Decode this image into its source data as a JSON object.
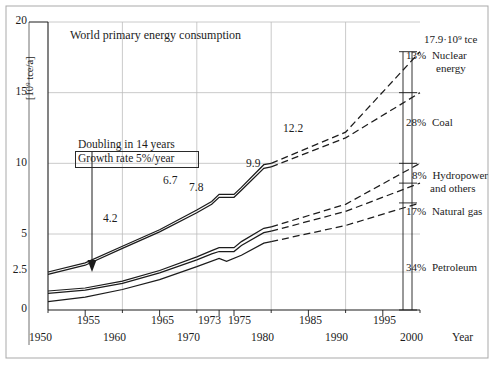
{
  "chart_data": {
    "type": "line",
    "title": "World primary energy consumption",
    "xlabel": "Year",
    "ylabel": "[10⁹ tce/a]",
    "xlim": [
      1950,
      2000
    ],
    "ylim": [
      0,
      20
    ],
    "grid": true,
    "legend_position": "right-outside",
    "y_ticks": [
      "0",
      "2.5",
      "5",
      "10",
      "15",
      "20"
    ],
    "y_tick_values": [
      0,
      2.5,
      5,
      10,
      15,
      20
    ],
    "x_ticks_upper": [
      "1955",
      "1965",
      "1973",
      "1975",
      "1985",
      "1995"
    ],
    "x_ticks_upper_values": [
      1955,
      1965,
      1973,
      1975,
      1985,
      1995
    ],
    "x_ticks_lower": [
      "1950",
      "1960",
      "1970",
      "1980",
      "1990",
      "2000"
    ],
    "x_ticks_lower_values": [
      1950,
      1960,
      1970,
      1980,
      1990,
      2000
    ],
    "annotations": [
      {
        "text": "Doubling in 14 years",
        "x": 1957.5,
        "y": 11.6
      },
      {
        "text": "Growth rate 5%/year",
        "x": 1957.5,
        "y": 10.6,
        "boxed": true
      }
    ],
    "data_labels": [
      {
        "text": "2.5",
        "value": 2.5,
        "x": 1950
      },
      {
        "text": "4.2",
        "value": 4.2,
        "x": 1960
      },
      {
        "text": "6.7",
        "value": 6.7,
        "x": 1970
      },
      {
        "text": "7.8",
        "value": 7.8,
        "x": 1973
      },
      {
        "text": "9.9",
        "value": 9.9,
        "x": 1979
      },
      {
        "text": "12.2",
        "value": 12.2,
        "x": 1990
      },
      {
        "text": "17.9·10⁹ tce",
        "value": 17.9,
        "x": 2000
      }
    ],
    "series": [
      {
        "name": "Total primary energy (cumulative top)",
        "style": "solid-then-dashed",
        "dash_from_x": 1980,
        "x": [
          1950,
          1955,
          1960,
          1965,
          1970,
          1972,
          1973,
          1975,
          1976,
          1979,
          1980,
          1990,
          2000
        ],
        "y": [
          2.5,
          3.1,
          4.2,
          5.3,
          6.7,
          7.3,
          7.8,
          7.8,
          8.3,
          9.9,
          10.0,
          12.2,
          17.9
        ]
      },
      {
        "name": "Total primary energy (cumulative, lower trace)",
        "style": "solid-then-dashed",
        "dash_from_x": 1980,
        "x": [
          1950,
          1955,
          1960,
          1965,
          1970,
          1972,
          1973,
          1975,
          1976,
          1979,
          1980,
          1990,
          2000
        ],
        "y": [
          2.35,
          2.95,
          4.05,
          5.15,
          6.5,
          7.1,
          7.6,
          7.6,
          8.1,
          9.65,
          9.75,
          11.8,
          15.0
        ]
      },
      {
        "name": "Fossil + hydro cumulative (upper)",
        "style": "solid-then-dashed",
        "dash_from_x": 1980,
        "x": [
          1950,
          1955,
          1960,
          1965,
          1970,
          1972,
          1973,
          1975,
          1976,
          1979,
          1980,
          1990,
          2000
        ],
        "y": [
          1.25,
          1.45,
          1.9,
          2.6,
          3.5,
          3.9,
          4.1,
          4.1,
          4.5,
          5.4,
          5.5,
          7.1,
          10.0
        ]
      },
      {
        "name": "Fossil + hydro cumulative (lower)",
        "style": "solid-then-dashed",
        "dash_from_x": 1980,
        "x": [
          1950,
          1955,
          1960,
          1965,
          1970,
          1972,
          1973,
          1975,
          1976,
          1979,
          1980,
          1990,
          2000
        ],
        "y": [
          1.1,
          1.3,
          1.75,
          2.45,
          3.3,
          3.7,
          3.85,
          3.85,
          4.25,
          5.1,
          5.2,
          6.6,
          8.6
        ]
      },
      {
        "name": "Petroleum + natural gas cumulative",
        "style": "solid-then-dashed",
        "dash_from_x": 1980,
        "x": [
          1950,
          1955,
          1960,
          1965,
          1970,
          1973,
          1974,
          1976,
          1979,
          1980,
          1990,
          2000
        ],
        "y": [
          0.55,
          0.85,
          1.35,
          2.0,
          2.85,
          3.4,
          3.2,
          3.6,
          4.4,
          4.5,
          5.6,
          7.2
        ]
      }
    ],
    "share_labels": [
      {
        "percent": "13%",
        "name": "Nuclear",
        "name2": "energy",
        "y_top": 17.9,
        "y_bottom": 15.0
      },
      {
        "percent": "28%",
        "name": "Coal",
        "name2": "",
        "y_top": 15.0,
        "y_bottom": 10.0
      },
      {
        "percent": "8%",
        "name": "Hydropower",
        "name2": "and others",
        "y_top": 10.0,
        "y_bottom": 8.6
      },
      {
        "percent": "17%",
        "name": "Natural gas",
        "name2": "",
        "y_top": 8.6,
        "y_bottom": 7.2
      },
      {
        "percent": "34%",
        "name": "Petroleum",
        "name2": "",
        "y_top": 7.2,
        "y_bottom": 0.0
      }
    ],
    "total_label": "17.9·10⁹ tce"
  },
  "colors": {
    "ink": "#1c1c1c",
    "grid": "#b8b8b8",
    "frame": "#9a9a9a",
    "background": "#ffffff"
  }
}
